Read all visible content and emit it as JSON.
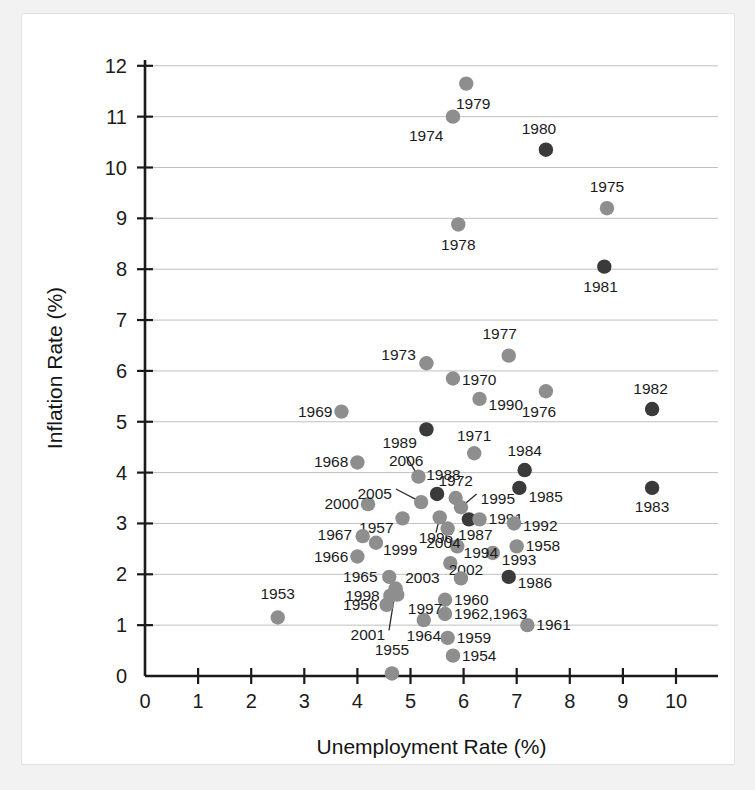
{
  "chart_data": {
    "type": "scatter",
    "title": "",
    "xlabel": "Unemployment Rate (%)",
    "ylabel": "Inflation Rate (%)",
    "xlim": [
      0,
      10.6
    ],
    "ylim": [
      0,
      12.4
    ],
    "xticks": [
      0,
      1,
      2,
      3,
      4,
      5,
      6,
      7,
      8,
      9,
      10
    ],
    "yticks": [
      0,
      1,
      2,
      3,
      4,
      5,
      6,
      7,
      8,
      9,
      10,
      11,
      12
    ],
    "grid": "horizontal",
    "legend": "none",
    "colors": {
      "light": "#8e8e8e",
      "dark": "#3a3a3a"
    },
    "points": [
      {
        "label": "1953",
        "x": 2.5,
        "y": 1.15,
        "tone": "light",
        "lx": 2.5,
        "ly": 1.62,
        "anchor": "middle"
      },
      {
        "label": "1954",
        "x": 5.8,
        "y": 0.4,
        "tone": "light",
        "lx": 5.97,
        "ly": 0.4,
        "anchor": "start"
      },
      {
        "label": "1955",
        "x": 4.65,
        "y": 0.05,
        "tone": "light",
        "lx": 4.65,
        "ly": 0.52,
        "anchor": "middle"
      },
      {
        "label": "1956",
        "x": 4.55,
        "y": 1.4,
        "tone": "light",
        "lx": 4.38,
        "ly": 1.4,
        "anchor": "end"
      },
      {
        "label": "1957",
        "x": 4.85,
        "y": 3.1,
        "tone": "light",
        "lx": 4.68,
        "ly": 2.92,
        "anchor": "end"
      },
      {
        "label": "1958",
        "x": 7.0,
        "y": 2.55,
        "tone": "light",
        "lx": 7.17,
        "ly": 2.55,
        "anchor": "start"
      },
      {
        "label": "1959",
        "x": 5.7,
        "y": 0.75,
        "tone": "light",
        "lx": 5.87,
        "ly": 0.75,
        "anchor": "start"
      },
      {
        "label": "1960",
        "x": 5.65,
        "y": 1.5,
        "tone": "light",
        "lx": 5.82,
        "ly": 1.5,
        "anchor": "start"
      },
      {
        "label": "1961",
        "x": 7.2,
        "y": 1.0,
        "tone": "light",
        "lx": 7.37,
        "ly": 1.0,
        "anchor": "start"
      },
      {
        "label": "1962,1963",
        "x": 5.65,
        "y": 1.22,
        "tone": "light",
        "lx": 5.82,
        "ly": 1.22,
        "anchor": "start"
      },
      {
        "label": "1964",
        "x": 5.25,
        "y": 1.1,
        "tone": "light",
        "lx": 5.25,
        "ly": 0.78,
        "anchor": "middle"
      },
      {
        "label": "1965",
        "x": 4.6,
        "y": 1.95,
        "tone": "light",
        "lx": 4.38,
        "ly": 1.95,
        "anchor": "end"
      },
      {
        "label": "1966",
        "x": 4.0,
        "y": 2.35,
        "tone": "light",
        "lx": 3.83,
        "ly": 2.35,
        "anchor": "end"
      },
      {
        "label": "1967",
        "x": 4.1,
        "y": 2.75,
        "tone": "light",
        "lx": 3.9,
        "ly": 2.78,
        "anchor": "end"
      },
      {
        "label": "1968",
        "x": 4.0,
        "y": 4.2,
        "tone": "light",
        "lx": 3.83,
        "ly": 4.2,
        "anchor": "end"
      },
      {
        "label": "1969",
        "x": 3.7,
        "y": 5.2,
        "tone": "light",
        "lx": 3.53,
        "ly": 5.2,
        "anchor": "end"
      },
      {
        "label": "1970",
        "x": 5.8,
        "y": 5.85,
        "tone": "light",
        "lx": 5.97,
        "ly": 5.82,
        "anchor": "start"
      },
      {
        "label": "1971",
        "x": 6.2,
        "y": 4.38,
        "tone": "light",
        "lx": 6.2,
        "ly": 4.72,
        "anchor": "middle"
      },
      {
        "label": "1972",
        "x": 5.85,
        "y": 3.5,
        "tone": "light",
        "lx": 5.85,
        "ly": 3.83,
        "anchor": "middle"
      },
      {
        "label": "1973",
        "x": 5.3,
        "y": 6.15,
        "tone": "light",
        "lx": 5.1,
        "ly": 6.32,
        "anchor": "end"
      },
      {
        "label": "1974",
        "x": 5.8,
        "y": 11.0,
        "tone": "light",
        "lx": 5.62,
        "ly": 10.62,
        "anchor": "end"
      },
      {
        "label": "1975",
        "x": 8.7,
        "y": 9.2,
        "tone": "light",
        "lx": 8.7,
        "ly": 9.62,
        "anchor": "middle"
      },
      {
        "label": "1976",
        "x": 7.55,
        "y": 5.6,
        "tone": "light",
        "lx": 7.42,
        "ly": 5.2,
        "anchor": "middle"
      },
      {
        "label": "1977",
        "x": 6.85,
        "y": 6.3,
        "tone": "light",
        "lx": 6.68,
        "ly": 6.72,
        "anchor": "middle"
      },
      {
        "label": "1978",
        "x": 5.9,
        "y": 8.88,
        "tone": "light",
        "lx": 5.9,
        "ly": 8.48,
        "anchor": "middle"
      },
      {
        "label": "1979",
        "x": 6.05,
        "y": 11.65,
        "tone": "light",
        "lx": 6.18,
        "ly": 11.25,
        "anchor": "middle"
      },
      {
        "label": "1980",
        "x": 7.55,
        "y": 10.35,
        "tone": "dark",
        "lx": 7.42,
        "ly": 10.75,
        "anchor": "middle"
      },
      {
        "label": "1981",
        "x": 8.65,
        "y": 8.05,
        "tone": "dark",
        "lx": 8.58,
        "ly": 7.65,
        "anchor": "middle"
      },
      {
        "label": "1982",
        "x": 9.55,
        "y": 5.25,
        "tone": "dark",
        "lx": 9.52,
        "ly": 5.65,
        "anchor": "middle"
      },
      {
        "label": "1983",
        "x": 9.55,
        "y": 3.7,
        "tone": "dark",
        "lx": 9.55,
        "ly": 3.32,
        "anchor": "middle"
      },
      {
        "label": "1984",
        "x": 7.15,
        "y": 4.05,
        "tone": "dark",
        "lx": 7.15,
        "ly": 4.42,
        "anchor": "middle"
      },
      {
        "label": "1985",
        "x": 7.05,
        "y": 3.7,
        "tone": "dark",
        "lx": 7.22,
        "ly": 3.52,
        "anchor": "start"
      },
      {
        "label": "1986",
        "x": 6.85,
        "y": 1.95,
        "tone": "dark",
        "lx": 7.02,
        "ly": 1.82,
        "anchor": "start"
      },
      {
        "label": "1987",
        "x": 6.1,
        "y": 3.08,
        "tone": "dark",
        "lx": 6.22,
        "ly": 2.78,
        "anchor": "middle"
      },
      {
        "label": "1988",
        "x": 5.5,
        "y": 3.58,
        "tone": "dark",
        "lx": 5.62,
        "ly": 3.95,
        "anchor": "middle"
      },
      {
        "label": "1989",
        "x": 5.3,
        "y": 4.85,
        "tone": "dark",
        "lx": 5.12,
        "ly": 4.58,
        "anchor": "end"
      },
      {
        "label": "1990",
        "x": 6.3,
        "y": 5.45,
        "tone": "light",
        "lx": 6.47,
        "ly": 5.32,
        "anchor": "start"
      },
      {
        "label": "1991",
        "x": 6.3,
        "y": 3.08,
        "tone": "light",
        "lx": 6.47,
        "ly": 3.08,
        "anchor": "start"
      },
      {
        "label": "1992",
        "x": 6.95,
        "y": 3.0,
        "tone": "light",
        "lx": 7.12,
        "ly": 2.95,
        "anchor": "start"
      },
      {
        "label": "1993",
        "x": 6.55,
        "y": 2.42,
        "tone": "light",
        "lx": 6.72,
        "ly": 2.28,
        "anchor": "start"
      },
      {
        "label": "1994",
        "x": 5.88,
        "y": 2.55,
        "tone": "light",
        "lx": 6.0,
        "ly": 2.42,
        "anchor": "start"
      },
      {
        "label": "1995",
        "x": 5.95,
        "y": 3.32,
        "tone": "light",
        "lx": 6.32,
        "ly": 3.48,
        "anchor": "start",
        "leader": true
      },
      {
        "label": "1996",
        "x": 5.55,
        "y": 3.12,
        "tone": "light",
        "lx": 5.48,
        "ly": 2.72,
        "anchor": "middle",
        "leader": true
      },
      {
        "label": "1997",
        "x": 4.75,
        "y": 1.6,
        "tone": "light",
        "lx": 4.95,
        "ly": 1.32,
        "anchor": "start"
      },
      {
        "label": "1998",
        "x": 4.62,
        "y": 1.58,
        "tone": "light",
        "lx": 4.42,
        "ly": 1.58,
        "anchor": "end"
      },
      {
        "label": "1999",
        "x": 4.35,
        "y": 2.62,
        "tone": "light",
        "lx": 4.48,
        "ly": 2.48,
        "anchor": "start"
      },
      {
        "label": "2000",
        "x": 4.2,
        "y": 3.38,
        "tone": "light",
        "lx": 4.03,
        "ly": 3.38,
        "anchor": "end"
      },
      {
        "label": "2001",
        "x": 4.72,
        "y": 1.72,
        "tone": "light",
        "lx": 4.52,
        "ly": 0.8,
        "anchor": "end",
        "leader": true
      },
      {
        "label": "2002",
        "x": 5.75,
        "y": 2.22,
        "tone": "light",
        "lx": 5.72,
        "ly": 2.08,
        "anchor": "start"
      },
      {
        "label": "2003",
        "x": 5.95,
        "y": 1.92,
        "tone": "light",
        "lx": 5.55,
        "ly": 1.92,
        "anchor": "end"
      },
      {
        "label": "2004",
        "x": 5.7,
        "y": 2.9,
        "tone": "light",
        "lx": 5.62,
        "ly": 2.62,
        "anchor": "middle"
      },
      {
        "label": "2005",
        "x": 5.2,
        "y": 3.42,
        "tone": "light",
        "lx": 4.65,
        "ly": 3.58,
        "anchor": "end",
        "leader": true
      },
      {
        "label": "2006",
        "x": 5.15,
        "y": 3.92,
        "tone": "light",
        "lx": 4.92,
        "ly": 4.22,
        "anchor": "middle",
        "leader": true
      }
    ]
  }
}
